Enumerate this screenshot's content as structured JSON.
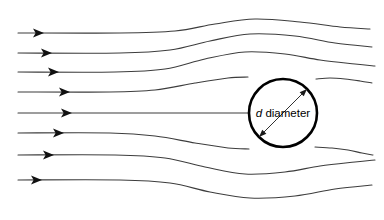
{
  "figure": {
    "background_color": "#ffffff",
    "width": 384,
    "height": 220
  },
  "annotations": {
    "diameter_symbol": "d",
    "diameter_label": "diameter"
  },
  "chart_data": {
    "type": "diagram",
    "xlabel": "",
    "ylabel": "",
    "grid": false,
    "legend": null,
    "cylinder": {
      "center_x": 283,
      "center_y": 113,
      "radius": 34,
      "stroke_color": "#000000",
      "stroke_width": 2.6,
      "label_symbol": "d",
      "label_text": "diameter"
    },
    "dimension_arrow": {
      "style": "double-headed",
      "x1": 259,
      "y1": 137,
      "x2": 307,
      "y2": 89,
      "color": "#1a1a1a"
    },
    "streamline_color": "#3d3d3d",
    "streamline_width": 1.1,
    "arrowhead_color": "#111111",
    "series": [
      {
        "name": "streamline-1",
        "inlet_y": 33,
        "outlet_y": 22,
        "arrow_x": 35,
        "points": [
          [
            18,
            33
          ],
          [
            120,
            33
          ],
          [
            175,
            31
          ],
          [
            215,
            24
          ],
          [
            255,
            19
          ],
          [
            300,
            22
          ],
          [
            340,
            27
          ],
          [
            370,
            29
          ]
        ]
      },
      {
        "name": "streamline-2",
        "inlet_y": 53,
        "outlet_y": 39,
        "arrow_x": 43,
        "points": [
          [
            18,
            53
          ],
          [
            120,
            53
          ],
          [
            170,
            50
          ],
          [
            210,
            41
          ],
          [
            250,
            34
          ],
          [
            295,
            36
          ],
          [
            335,
            43
          ],
          [
            372,
            47
          ]
        ]
      },
      {
        "name": "streamline-3",
        "inlet_y": 72,
        "outlet_y": 60,
        "arrow_x": 50,
        "points": [
          [
            18,
            72
          ],
          [
            115,
            72
          ],
          [
            165,
            69
          ],
          [
            205,
            59
          ],
          [
            245,
            52
          ],
          [
            285,
            54
          ],
          [
            320,
            60
          ],
          [
            355,
            64
          ],
          [
            375,
            66
          ]
        ]
      },
      {
        "name": "streamline-4",
        "inlet_y": 92,
        "outlet_y": 80,
        "arrow_x": 61,
        "points": [
          [
            18,
            92
          ],
          [
            110,
            92
          ],
          [
            155,
            90
          ],
          [
            195,
            83
          ],
          [
            228,
            78
          ],
          [
            248,
            77
          ]
        ]
      },
      {
        "name": "streamline-5",
        "inlet_y": 113,
        "outlet_y": 113,
        "arrow_x": 63,
        "points": [
          [
            18,
            113
          ],
          [
            110,
            113
          ],
          [
            160,
            113
          ],
          [
            200,
            113
          ],
          [
            235,
            113
          ],
          [
            249,
            113
          ]
        ]
      },
      {
        "name": "streamline-6",
        "inlet_y": 133,
        "outlet_y": 146,
        "arrow_x": 55,
        "points": [
          [
            18,
            133
          ],
          [
            110,
            133
          ],
          [
            155,
            136
          ],
          [
            195,
            143
          ],
          [
            228,
            148
          ],
          [
            249,
            149
          ]
        ]
      },
      {
        "name": "streamline-7",
        "inlet_y": 155,
        "outlet_y": 170,
        "arrow_x": 45,
        "points": [
          [
            18,
            155
          ],
          [
            115,
            155
          ],
          [
            165,
            158
          ],
          [
            205,
            167
          ],
          [
            245,
            174
          ],
          [
            285,
            172
          ],
          [
            320,
            166
          ],
          [
            355,
            162
          ],
          [
            375,
            160
          ]
        ]
      },
      {
        "name": "streamline-8",
        "inlet_y": 180,
        "outlet_y": 195,
        "arrow_x": 33,
        "points": [
          [
            18,
            180
          ],
          [
            120,
            180
          ],
          [
            170,
            183
          ],
          [
            210,
            192
          ],
          [
            250,
            198
          ],
          [
            295,
            196
          ],
          [
            335,
            189
          ],
          [
            372,
            185
          ]
        ]
      },
      {
        "name": "streamline-4-wake",
        "inlet_y": null,
        "outlet_y": 80,
        "arrow_x": null,
        "points": [
          [
            316,
            79
          ],
          [
            330,
            78
          ],
          [
            345,
            79
          ],
          [
            360,
            81
          ],
          [
            372,
            83
          ]
        ]
      },
      {
        "name": "streamline-6-wake",
        "inlet_y": null,
        "outlet_y": 146,
        "arrow_x": null,
        "points": [
          [
            315,
            147
          ],
          [
            332,
            148
          ],
          [
            348,
            150
          ],
          [
            362,
            153
          ],
          [
            373,
            155
          ]
        ]
      }
    ]
  }
}
